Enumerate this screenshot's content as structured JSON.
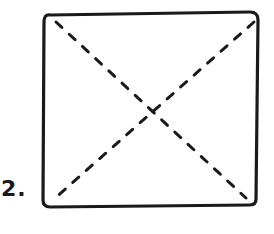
{
  "figure": {
    "label": "2.",
    "shape": "square",
    "diagonals": "dashed",
    "stroke_color": "#1a1a1a",
    "background": "#ffffff"
  }
}
